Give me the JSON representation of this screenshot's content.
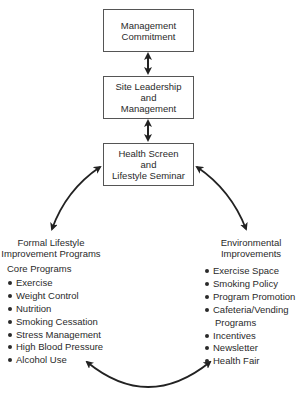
{
  "boxes": [
    {
      "lines": [
        "Management",
        "Commitment"
      ]
    },
    {
      "lines": [
        "Site Leadership",
        "and",
        "Management"
      ]
    },
    {
      "lines": [
        "Health Screen",
        "and",
        "Lifestyle Seminar"
      ]
    }
  ],
  "left": {
    "heading": [
      "Formal Lifestyle",
      "Improvement Programs"
    ],
    "subheading": "Core Programs",
    "items": [
      "Exercise",
      "Weight Control",
      "Nutrition",
      "Smoking Cessation",
      "Stress Management",
      "High Blood Pressure",
      "Alcohol Use"
    ]
  },
  "right": {
    "heading": [
      "Environmental",
      "Improvements"
    ],
    "items": [
      "Exercise Space",
      "Smoking Policy",
      "Program Promotion",
      "Cafeteria/Vending",
      "Programs",
      "Incentives",
      "Newsletter",
      "Health Fair"
    ]
  },
  "colors": {
    "line": "#222222",
    "box_border": "#555555",
    "text": "#2a2a2a"
  }
}
